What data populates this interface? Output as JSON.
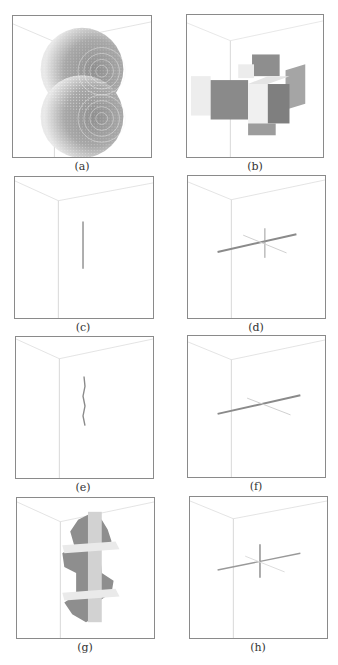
{
  "figure": {
    "panels": [
      {
        "id": "a",
        "caption": "(a)",
        "content": "two stacked voxelized spheres"
      },
      {
        "id": "b",
        "caption": "(b)",
        "content": "3D cross of cubes"
      },
      {
        "id": "c",
        "caption": "(c)",
        "content": "vertical line segment"
      },
      {
        "id": "d",
        "caption": "(d)",
        "content": "3D cross of thin lines"
      },
      {
        "id": "e",
        "caption": "(e)",
        "content": "vertical jagged line segment"
      },
      {
        "id": "f",
        "caption": "(f)",
        "content": "3D cross of thin lines"
      },
      {
        "id": "g",
        "caption": "(g)",
        "content": "voxelized vertical skeleton with two cross sections"
      },
      {
        "id": "h",
        "caption": "(h)",
        "content": "3D cross of thin lines"
      }
    ]
  },
  "colors": {
    "frame": "#8a8a8a",
    "wire": "#d4d4d4",
    "dark": "#8c8c8c",
    "mid": "#b5b5b5",
    "light": "#e6e6e6"
  }
}
